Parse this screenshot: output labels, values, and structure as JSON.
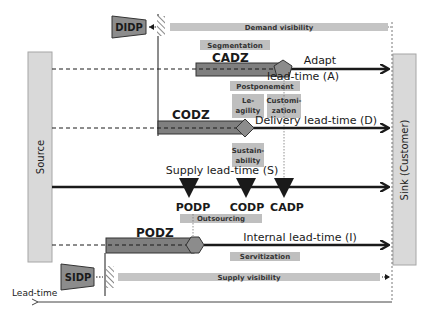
{
  "diagram": {
    "colors": {
      "source_sink_fill": "#d9d9d9",
      "source_sink_stroke": "#a6a6a6",
      "zone_fill": "#7f7f7f",
      "tag_fill": "#bfbfbf",
      "visibility_bar": "#c4c4c4",
      "decoupling_point_fill": "#8c8c8c",
      "line": "#1a1a1a"
    },
    "source": {
      "label": "Source"
    },
    "sink": {
      "label": "Sink (Customer)"
    },
    "axis": {
      "label": "Lead-time"
    },
    "visibility": {
      "demand": {
        "label": "Demand visibility",
        "point": "DIDP"
      },
      "supply": {
        "label": "Supply visibility",
        "point": "SIDP"
      }
    },
    "lead_times": [
      {
        "id": "A",
        "label_line1": "Adapt",
        "label_line2": "lead-time (A)",
        "zone": "CADZ"
      },
      {
        "id": "D",
        "label": "Delivery lead-time (D)",
        "zone": "CODZ"
      },
      {
        "id": "S",
        "label": "Supply lead-time (S)"
      },
      {
        "id": "I",
        "label": "Internal lead-time (I)",
        "zone": "PODZ"
      }
    ],
    "decoupling_points": [
      {
        "label": "PODP"
      },
      {
        "label": "CODP"
      },
      {
        "label": "CADP"
      }
    ],
    "tags": {
      "segmentation": "Segmentation",
      "postponement": "Postponement",
      "leagility_1": "Le-",
      "leagility_2": "agility",
      "customization_1": "Customi-",
      "customization_2": "zation",
      "sustainability_1": "Sustain-",
      "sustainability_2": "ability",
      "outsourcing": "Outsourcing",
      "servitization": "Servitization"
    }
  }
}
